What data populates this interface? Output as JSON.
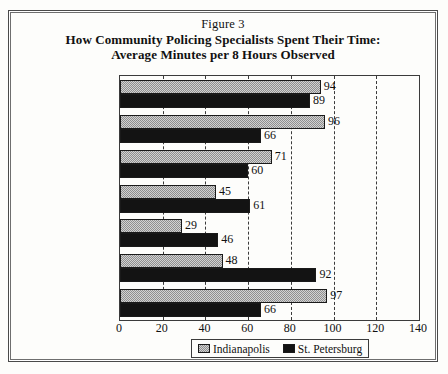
{
  "figure": {
    "caption": "Figure 3",
    "title_line1": "How Community Policing Specialists Spent Their Time:",
    "title_line2": "Average Minutes per 8 Hours Observed"
  },
  "legend": {
    "position": "bottom",
    "items": [
      {
        "label": "Indianapolis",
        "swatch": "light-dotted-swatch"
      },
      {
        "label": "St. Petersburg",
        "swatch": "solid-black-swatch"
      }
    ]
  },
  "chart_data": {
    "type": "bar",
    "orientation": "horizontal",
    "title": "How Community Policing Specialists Spent Their Time: Average Minutes per 8 Hours Observed",
    "subtitle": "Figure 3",
    "xlabel": "",
    "ylabel": "",
    "xlim": [
      0,
      140
    ],
    "xticks": [
      0,
      20,
      40,
      60,
      80,
      100,
      120,
      140
    ],
    "tick_labels": [
      "0",
      "20",
      "40",
      "60",
      "80",
      "100",
      "120",
      "140"
    ],
    "grid": true,
    "grid_axis": "x",
    "grid_style": "dashed",
    "legend_position": "bottom-center",
    "categories": [
      "Encounters",
      "General Patrol",
      "En Route",
      "Problem-Directed",
      "Info Gathering",
      "Administrative",
      "Personal"
    ],
    "series": [
      {
        "name": "Indianapolis",
        "color": "#d2d2d2",
        "values": [
          94,
          96,
          71,
          45,
          29,
          48,
          97
        ]
      },
      {
        "name": "St. Petersburg",
        "color": "#131313",
        "values": [
          89,
          66,
          60,
          61,
          46,
          92,
          66
        ]
      }
    ]
  }
}
